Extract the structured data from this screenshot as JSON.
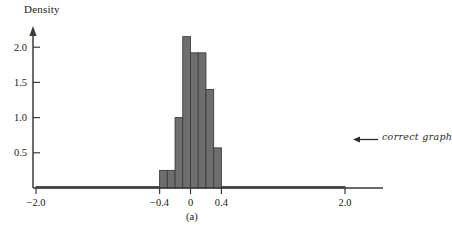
{
  "figure": {
    "caption": "(a)",
    "annotation": "correct graph",
    "annotation_arrow": "left-arrow"
  },
  "chart_data": {
    "type": "bar",
    "title": "",
    "subtitle": "",
    "xlabel": "",
    "ylabel": "Density",
    "xlim": [
      -2.0,
      2.0
    ],
    "ylim": [
      0,
      2.3
    ],
    "grid": false,
    "legend": null,
    "bar_color": "#6e6e6e",
    "bar_edge_color": "#3d3d3d",
    "axis_color": "#3a3a3a",
    "xticks": [
      -2.0,
      -0.4,
      0,
      0.4,
      2.0
    ],
    "xtick_labels": [
      "−2.0",
      "−0.4",
      "0",
      "0.4",
      "2.0"
    ],
    "yticks": [
      0.5,
      1.0,
      1.5,
      2.0
    ],
    "ytick_labels": [
      "0.5",
      "1.0",
      "1.5",
      "2.0"
    ],
    "bin_edges": [
      -2.0,
      -0.4,
      -0.3,
      -0.2,
      -0.1,
      0.0,
      0.1,
      0.2,
      0.3,
      0.4,
      2.0
    ],
    "values": [
      0.02,
      0.25,
      1.0,
      2.15,
      2.15,
      1.92,
      1.4,
      1.4,
      0.57,
      0.02
    ],
    "bars": [
      {
        "x0": -2.0,
        "x1": -0.4,
        "height": 0.02
      },
      {
        "x0": -0.4,
        "x1": -0.3,
        "height": 0.25
      },
      {
        "x0": -0.3,
        "x1": -0.2,
        "height": 0.25
      },
      {
        "x0": -0.2,
        "x1": -0.1,
        "height": 1.0
      },
      {
        "x0": -0.1,
        "x1": 0.0,
        "height": 2.15
      },
      {
        "x0": 0.0,
        "x1": 0.1,
        "height": 1.92
      },
      {
        "x0": 0.1,
        "x1": 0.2,
        "height": 1.92
      },
      {
        "x0": 0.2,
        "x1": 0.3,
        "height": 1.4
      },
      {
        "x0": 0.3,
        "x1": 0.4,
        "height": 0.57
      },
      {
        "x0": 0.4,
        "x1": 2.0,
        "height": 0.02
      }
    ]
  }
}
